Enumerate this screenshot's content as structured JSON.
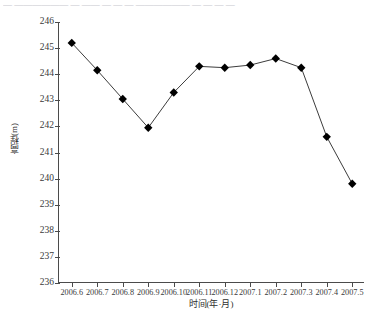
{
  "top_partial_text": "— —————— — —— — — — —————— — — — —",
  "chart_data": {
    "type": "line",
    "title": "",
    "xlabel": "时间(年·月)",
    "ylabel": "高程(m)",
    "categories": [
      "2006.6",
      "2006.7",
      "2006.8",
      "2006.9",
      "2006.10",
      "2006.11",
      "2006.12",
      "2007.1",
      "2007.2",
      "2007.3",
      "2007.4",
      "2007.5"
    ],
    "values": [
      245.2,
      244.15,
      243.05,
      241.95,
      243.3,
      244.3,
      244.25,
      244.35,
      244.6,
      244.25,
      241.6,
      239.8
    ],
    "ylim": [
      236,
      246
    ],
    "yticks": [
      236,
      237,
      238,
      239,
      240,
      241,
      242,
      243,
      244,
      245,
      246
    ],
    "ytick_labels": [
      "236",
      "237",
      "238",
      "239",
      "240",
      "241",
      "242",
      "243",
      "244",
      "245",
      "246"
    ],
    "grid": false,
    "legend": "none",
    "marker": "diamond",
    "line_color": "#3c3c3c",
    "marker_color": "#000000"
  }
}
